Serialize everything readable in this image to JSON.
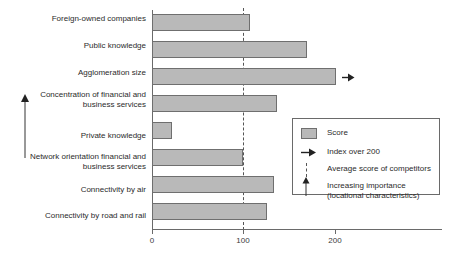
{
  "chart_data": {
    "type": "bar",
    "orientation": "horizontal",
    "title": "",
    "xlabel": "",
    "ylabel": "",
    "xlim": [
      0,
      200
    ],
    "xticks": [
      0,
      100,
      200
    ],
    "xtick_labels": [
      "0",
      "100",
      "200"
    ],
    "grid": false,
    "categories": [
      "Foreign-owned companies",
      "Public knowledge",
      "Agglomeration size",
      "Concentration of financial and\nbusiness services",
      "Private knowledge",
      "Network orientation financial and\nbusiness services",
      "Connectivity by air",
      "Connectivity by road and rail"
    ],
    "series": [
      {
        "name": "Score",
        "values": [
          107,
          168,
          200,
          136,
          22,
          99,
          133,
          125
        ]
      }
    ],
    "over_limit_flags": [
      false,
      false,
      true,
      false,
      false,
      false,
      false,
      false
    ],
    "reference_line": {
      "label": "Average score of competitors",
      "value": 100,
      "style": "dashed"
    },
    "annotations": {
      "increasing_importance": "Increasing importance\n(locational characteristics)"
    },
    "legend": {
      "position": "right-inside",
      "entries": [
        {
          "key": "score-swatch",
          "label": "Score"
        },
        {
          "key": "over-200-arrow",
          "label": "Index over 200"
        },
        {
          "key": "average-dashed-line",
          "label": "Average score of competitors"
        },
        {
          "key": "increasing-importance-arrow",
          "label": "Increasing importance\n(locational characteristics)"
        }
      ]
    },
    "colors": {
      "bar_fill": "#b9b9b9",
      "bar_stroke": "#6f6f6f",
      "axis": "#6a6a6a",
      "reference_line": "#555555",
      "text": "#2b2b2b",
      "background": "#ffffff"
    }
  }
}
